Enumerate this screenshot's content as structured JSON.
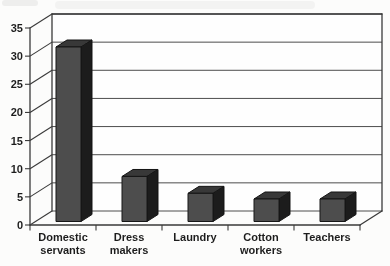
{
  "chart_data": {
    "type": "bar",
    "projection": "3d-oblique",
    "title": "",
    "xlabel": "",
    "ylabel": "",
    "categories": [
      "Domestic servants",
      "Dress makers",
      "Laundry",
      "Cotton workers",
      "Teachers"
    ],
    "category_label_lines": [
      [
        "Domestic",
        "servants"
      ],
      [
        "Dress",
        "makers"
      ],
      [
        "Laundry"
      ],
      [
        "Cotton",
        "workers"
      ],
      [
        "Teachers"
      ]
    ],
    "values": [
      31,
      8,
      5,
      4,
      4
    ],
    "ylim": [
      0,
      35
    ],
    "yticks": [
      0,
      5,
      10,
      15,
      20,
      25,
      30,
      35
    ],
    "ytick_labels": [
      "0",
      "5",
      "10",
      "15",
      "20",
      "25",
      "30",
      "35"
    ],
    "grid": true,
    "legend": false,
    "colors": {
      "bar_front": "#4e4e4e",
      "bar_top": "#373737",
      "bar_side": "#1d1d1d",
      "bar_outline": "#161616",
      "line": "#3a3a3a",
      "grid_line": "#4d4d4d",
      "text": "#1f1f1f",
      "paper": "#fcfcfb",
      "wall": "#fefefe"
    }
  }
}
